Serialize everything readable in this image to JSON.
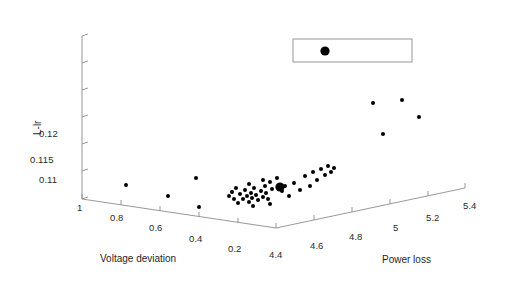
{
  "figure": {
    "type": "3d-scatter",
    "background": "#ffffff",
    "axis_color": "#8d8d8d",
    "marker_color": "#000000"
  },
  "chart_data": {
    "type": "scatter",
    "title": "",
    "projection": "3d",
    "xlabel": "Voltage deviation",
    "ylabel": "Power loss",
    "zlabel": "L-lr",
    "grid": false,
    "legend": {
      "present": true,
      "entries": [
        ""
      ],
      "position": "top-right",
      "box": true
    },
    "axes": {
      "voltage_deviation": {
        "label": "Voltage deviation",
        "ticks": [
          "1",
          "0.8",
          "0.6",
          "0.4",
          "0.2"
        ],
        "values": [
          1,
          0.8,
          0.6,
          0.4,
          0.2
        ],
        "range": [
          0.2,
          1
        ],
        "direction": "decreasing-left-to-right"
      },
      "power_loss": {
        "label": "Power loss",
        "ticks": [
          "4.4",
          "4.6",
          "4.8",
          "5",
          "5.2",
          "5.4"
        ],
        "values": [
          4.4,
          4.6,
          4.8,
          5,
          5.2,
          5.4
        ],
        "range": [
          4.4,
          5.4
        ],
        "direction": "increasing-left-to-right"
      },
      "l_index": {
        "label": "L-lr",
        "ticks": [
          "0.11",
          "0.115",
          "0.12",
          "",
          "",
          ""
        ],
        "values": [
          0.11,
          0.115,
          0.12,
          0.125,
          0.13,
          0.135
        ],
        "range": [
          0.11,
          0.135
        ],
        "tick_step": 0.005,
        "labeled_count": 3,
        "unlabeled_count": 3
      }
    },
    "series": [
      {
        "name": "solutions",
        "marker": "filled-circle",
        "color": "#000000",
        "points_px": [
          [
            126,
            185,
            2.0
          ],
          [
            168,
            196,
            2.0
          ],
          [
            196,
            178,
            2.0
          ],
          [
            199,
            207,
            2.0
          ],
          [
            229,
            196,
            2.0
          ],
          [
            232,
            192,
            2.0
          ],
          [
            234,
            199,
            2.0
          ],
          [
            236,
            188,
            2.0
          ],
          [
            238,
            203,
            2.0
          ],
          [
            240,
            194,
            2.0
          ],
          [
            243,
            199,
            2.0
          ],
          [
            245,
            190,
            2.0
          ],
          [
            247,
            196,
            2.0
          ],
          [
            249,
            202,
            2.0
          ],
          [
            251,
            193,
            2.0
          ],
          [
            252,
            198,
            2.0
          ],
          [
            254,
            188,
            2.0
          ],
          [
            256,
            195,
            2.0
          ],
          [
            258,
            200,
            2.0
          ],
          [
            253,
            206,
            2.0
          ],
          [
            261,
            191,
            2.0
          ],
          [
            263,
            197,
            2.0
          ],
          [
            265,
            186,
            2.0
          ],
          [
            266,
            193,
            2.0
          ],
          [
            268,
            199,
            2.0
          ],
          [
            270,
            204,
            2.0
          ],
          [
            272,
            189,
            2.0
          ],
          [
            249,
            184,
            2.0
          ],
          [
            263,
            180,
            2.0
          ],
          [
            270,
            182,
            2.0
          ],
          [
            277,
            178,
            2.0
          ],
          [
            282,
            191,
            2.0
          ],
          [
            285,
            186,
            2.0
          ],
          [
            289,
            196,
            2.0
          ],
          [
            294,
            183,
            2.0
          ],
          [
            300,
            190,
            2.0
          ],
          [
            305,
            176,
            2.0
          ],
          [
            310,
            186,
            2.0
          ],
          [
            313,
            172,
            2.0
          ],
          [
            317,
            180,
            2.0
          ],
          [
            321,
            169,
            2.0
          ],
          [
            325,
            175,
            2.0
          ],
          [
            328,
            166,
            2.0
          ],
          [
            331,
            172,
            2.0
          ],
          [
            334,
            168,
            2.0
          ],
          [
            280,
            187,
            4.6
          ],
          [
            373,
            103,
            2.0
          ],
          [
            383,
            134,
            2.0
          ],
          [
            402,
            100,
            2.0
          ],
          [
            419,
            117,
            2.0
          ]
        ],
        "count": 50,
        "highlighted_point_px": [
          280,
          187
        ]
      }
    ],
    "annotations": [
      {
        "kind": "legend-box",
        "x": 293,
        "y": 39,
        "width": 119,
        "height": 23
      },
      {
        "kind": "legend-marker",
        "x": 325,
        "y": 51,
        "radius": 4.6
      }
    ]
  },
  "ticks": {
    "z": [
      {
        "label": "0.12",
        "x": 39,
        "y": 134
      },
      {
        "label": "0.115",
        "x": 32,
        "y": 160
      },
      {
        "label": "0.11",
        "x": 39,
        "y": 180
      }
    ],
    "x": [
      {
        "label": "1",
        "x": 79,
        "y": 200
      },
      {
        "label": "0.8",
        "x": 113,
        "y": 210
      },
      {
        "label": "0.6",
        "x": 152,
        "y": 221
      },
      {
        "label": "0.4",
        "x": 192,
        "y": 232
      },
      {
        "label": "0.2",
        "x": 231,
        "y": 242
      }
    ],
    "y": [
      {
        "label": "4.4",
        "x": 272,
        "y": 250
      },
      {
        "label": "4.6",
        "x": 313,
        "y": 240
      },
      {
        "label": "4.8",
        "x": 352,
        "y": 230
      },
      {
        "label": "5",
        "x": 396,
        "y": 220
      },
      {
        "label": "5.2",
        "x": 429,
        "y": 210
      },
      {
        "label": "5.4",
        "x": 466,
        "y": 199
      }
    ]
  },
  "titles": {
    "voltage_deviation": "Voltage deviation",
    "power_loss": "Power loss",
    "l_index": "L-lr"
  }
}
